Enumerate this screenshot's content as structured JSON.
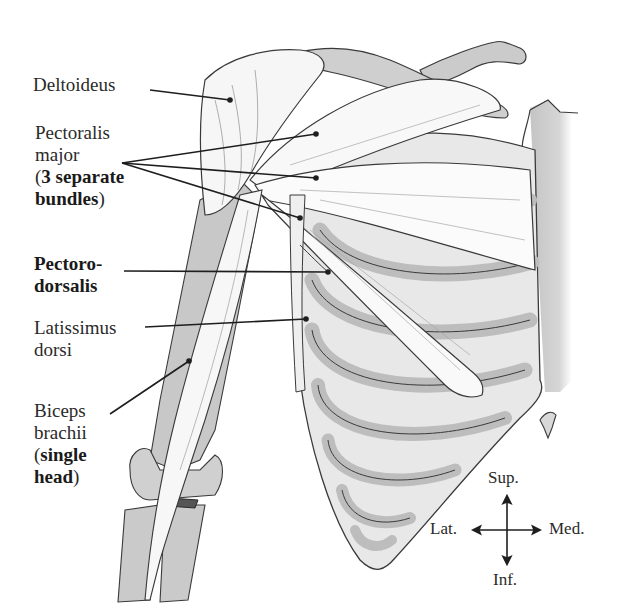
{
  "figure": {
    "type": "anatomical-illustration",
    "view": "anterior view of right shoulder, arm and thorax",
    "colors": {
      "background": "#ffffff",
      "bone_fill": "#c9c9c9",
      "muscle_fill": "#f4f4f4",
      "outline": "#3a3a3a",
      "leader_line": "#1e1e1e",
      "label_text": "#2a2a2a"
    }
  },
  "labels": [
    {
      "id": "deltoideus",
      "lines": [
        {
          "text": "Deltoideus",
          "bold": false
        }
      ]
    },
    {
      "id": "pectoralis-major",
      "lines": [
        {
          "text": "Pectoralis",
          "bold": false
        },
        {
          "text": "major",
          "bold": false
        },
        {
          "prefix": "(",
          "text": "3 separate",
          "bold": true
        },
        {
          "text": "bundles",
          "bold": true,
          "suffix": ")"
        }
      ],
      "leader_count": 3
    },
    {
      "id": "pectorodorsalis",
      "lines": [
        {
          "text": "Pectoro-",
          "bold": true
        },
        {
          "text": "dorsalis",
          "bold": true
        }
      ]
    },
    {
      "id": "latissimus-dorsi",
      "lines": [
        {
          "text": "Latissimus",
          "bold": false
        },
        {
          "text": "dorsi",
          "bold": false
        }
      ]
    },
    {
      "id": "biceps-brachii",
      "lines": [
        {
          "text": "Biceps",
          "bold": false
        },
        {
          "text": "brachii",
          "bold": false
        },
        {
          "prefix": "(",
          "text": "single",
          "bold": true
        },
        {
          "text": "head",
          "bold": true,
          "suffix": ")"
        }
      ]
    }
  ],
  "labels_text": {
    "deltoideus": "Deltoideus",
    "pect_1": "Pectoralis",
    "pect_2": "major",
    "pect_3_open": "(",
    "pect_3": "3 separate",
    "pect_4": "bundles",
    "pect_4_close": ")",
    "pd_1": "Pectoro-",
    "pd_2": "dorsalis",
    "lat_1": "Latissimus",
    "lat_2": "dorsi",
    "bic_1": "Biceps",
    "bic_2": "brachii",
    "bic_3_open": "(",
    "bic_3": "single",
    "bic_4": "head",
    "bic_4_close": ")"
  },
  "orientation": {
    "superior": "Sup.",
    "inferior": "Inf.",
    "lateral": "Lat.",
    "medial": "Med."
  }
}
